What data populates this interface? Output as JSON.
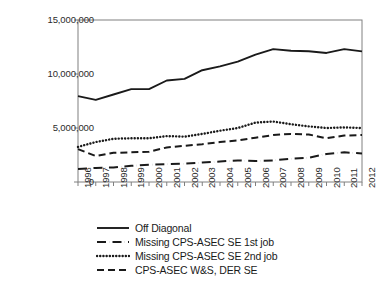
{
  "chart_data": {
    "type": "line",
    "title": "",
    "subtitle": "",
    "xlabel": "",
    "ylabel": "",
    "grid": false,
    "legend_position": "bottom",
    "ylim": [
      0,
      15000000
    ],
    "y_ticks": [
      0,
      5000000,
      10000000,
      15000000
    ],
    "y_tick_labels": [
      "0",
      "5,000,000",
      "10,000,000",
      "15,000,000"
    ],
    "categories": [
      "1996",
      "1997",
      "1998",
      "1999",
      "2000",
      "2001",
      "2002",
      "2003",
      "2004",
      "2005",
      "2006",
      "2007",
      "2008",
      "2009",
      "2010",
      "2011",
      "2012"
    ],
    "x_tick_rotation": -90,
    "series": [
      {
        "name": "Off Diagonal",
        "style": "solid",
        "color": "#1a1a1a",
        "values": [
          7950000,
          7600000,
          8100000,
          8600000,
          8600000,
          9400000,
          9550000,
          10350000,
          10700000,
          11150000,
          11800000,
          12300000,
          12150000,
          12100000,
          11950000,
          12300000,
          12100000
        ]
      },
      {
        "name": "Missing CPS-ASEC SE 1st job",
        "style": "dashdot",
        "color": "#1a1a1a",
        "values": [
          1200000,
          1300000,
          1350000,
          1500000,
          1600000,
          1650000,
          1700000,
          1800000,
          1900000,
          2000000,
          1950000,
          2000000,
          2150000,
          2250000,
          2600000,
          2750000,
          2650000
        ]
      },
      {
        "name": "Missing CPS-ASEC SE 2nd job",
        "style": "dotted",
        "color": "#1a1a1a",
        "values": [
          3250000,
          3700000,
          4000000,
          4050000,
          4050000,
          4250000,
          4200000,
          4450000,
          4750000,
          5000000,
          5500000,
          5600000,
          5350000,
          5150000,
          5000000,
          5050000,
          5000000
        ]
      },
      {
        "name": "CPS-ASEC W&S, DER SE",
        "style": "dashed",
        "color": "#1a1a1a",
        "values": [
          3050000,
          2400000,
          2700000,
          2750000,
          2800000,
          3200000,
          3350000,
          3500000,
          3700000,
          3850000,
          4100000,
          4350000,
          4450000,
          4400000,
          4050000,
          4300000,
          4350000
        ]
      }
    ]
  },
  "legend": {
    "items": [
      {
        "label": "Off Diagonal",
        "style": "solid"
      },
      {
        "label": "Missing CPS-ASEC SE 1st job",
        "style": "dashdot"
      },
      {
        "label": "Missing CPS-ASEC SE 2nd job",
        "style": "dotted"
      },
      {
        "label": "CPS-ASEC W&S, DER SE",
        "style": "dashed"
      }
    ]
  },
  "axes": {
    "frame_color": "#808080",
    "tick_color": "#808080",
    "label_color": "#2b2b2b"
  }
}
